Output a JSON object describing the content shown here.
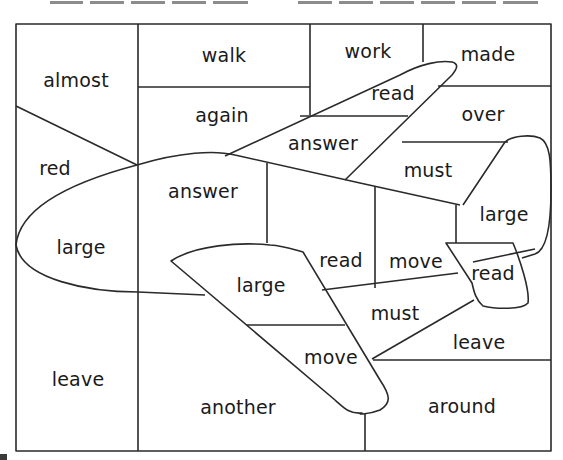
{
  "worksheet": {
    "answer_blanks": {
      "left_group_count": 5,
      "right_group_count": 6
    },
    "regions": [
      {
        "id": "almost",
        "label": "almost"
      },
      {
        "id": "walk",
        "label": "walk"
      },
      {
        "id": "work",
        "label": "work"
      },
      {
        "id": "made",
        "label": "made"
      },
      {
        "id": "read-1",
        "label": "read"
      },
      {
        "id": "again",
        "label": "again"
      },
      {
        "id": "over",
        "label": "over"
      },
      {
        "id": "answer-1",
        "label": "answer"
      },
      {
        "id": "red",
        "label": "red"
      },
      {
        "id": "must-1",
        "label": "must"
      },
      {
        "id": "answer-2",
        "label": "answer"
      },
      {
        "id": "large-1",
        "label": "large"
      },
      {
        "id": "large-2",
        "label": "large"
      },
      {
        "id": "read-2",
        "label": "read"
      },
      {
        "id": "move-1",
        "label": "move"
      },
      {
        "id": "read-3",
        "label": "read"
      },
      {
        "id": "large-3",
        "label": "large"
      },
      {
        "id": "must-2",
        "label": "must"
      },
      {
        "id": "leave-1",
        "label": "leave"
      },
      {
        "id": "move-2",
        "label": "move"
      },
      {
        "id": "leave-2",
        "label": "leave"
      },
      {
        "id": "another",
        "label": "another"
      },
      {
        "id": "around",
        "label": "around"
      }
    ],
    "colors": {
      "line": "#2a2a2a",
      "text": "#1a1a1a",
      "blank": "#8c8c8c",
      "background": "#ffffff"
    }
  }
}
